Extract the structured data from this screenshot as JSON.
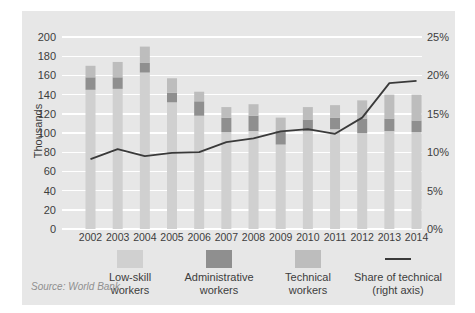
{
  "source_note": "Source: World Bank",
  "colors": {
    "panel_bg": "#e7e7e7",
    "gridline": "#ffffff",
    "low_skill": "#d0d0d0",
    "administrative": "#8f8f8f",
    "technical": "#bdbdbd",
    "line": "#3a3a3a",
    "axis_text": "#3d3d3d",
    "source_text": "#8f8f8f"
  },
  "chart_data": {
    "type": "bar-line-combo",
    "title": "",
    "categories": [
      "2002",
      "2003",
      "2004",
      "2005",
      "2006",
      "2007",
      "2008",
      "2009",
      "2010",
      "2011",
      "2012",
      "2013",
      "2014"
    ],
    "series": [
      {
        "name": "Low-skill workers",
        "key": "low_skill",
        "type": "bar",
        "axis": "left",
        "values": [
          145,
          146,
          163,
          132,
          118,
          101,
          102,
          88,
          102,
          104,
          100,
          102,
          101
        ]
      },
      {
        "name": "Administrative workers",
        "key": "administrative",
        "type": "bar",
        "axis": "left",
        "values": [
          13,
          12,
          10,
          10,
          15,
          15,
          16,
          14,
          12,
          12,
          15,
          13,
          12
        ]
      },
      {
        "name": "Technical workers",
        "key": "technical",
        "type": "bar",
        "axis": "left",
        "values": [
          12,
          16,
          17,
          15,
          10,
          11,
          12,
          14,
          13,
          13,
          19,
          25,
          27
        ]
      },
      {
        "name": "Share of technical (right axis)",
        "key": "share_of_technical",
        "type": "line",
        "axis": "right",
        "values": [
          9.1,
          10.4,
          9.5,
          9.9,
          10.0,
          11.3,
          11.8,
          12.7,
          13.0,
          12.4,
          14.5,
          19.0,
          19.3
        ]
      }
    ],
    "bars_stacked": true,
    "left_axis": {
      "label": "Thousands",
      "min": 0,
      "max": 200,
      "tick_step": 20
    },
    "right_axis": {
      "label": "",
      "min": 0,
      "max": 25,
      "tick_step": 5,
      "unit": "%"
    },
    "grid": true,
    "legend_position": "bottom"
  },
  "legend": {
    "items": [
      {
        "label": "Low-skill\nworkers",
        "swatch": "square",
        "color_key": "low_skill"
      },
      {
        "label": "Administrative\nworkers",
        "swatch": "square",
        "color_key": "administrative"
      },
      {
        "label": "Technical\nworkers",
        "swatch": "square",
        "color_key": "technical"
      },
      {
        "label": "Share of technical\n(right axis)",
        "swatch": "line",
        "color_key": "line"
      }
    ]
  }
}
